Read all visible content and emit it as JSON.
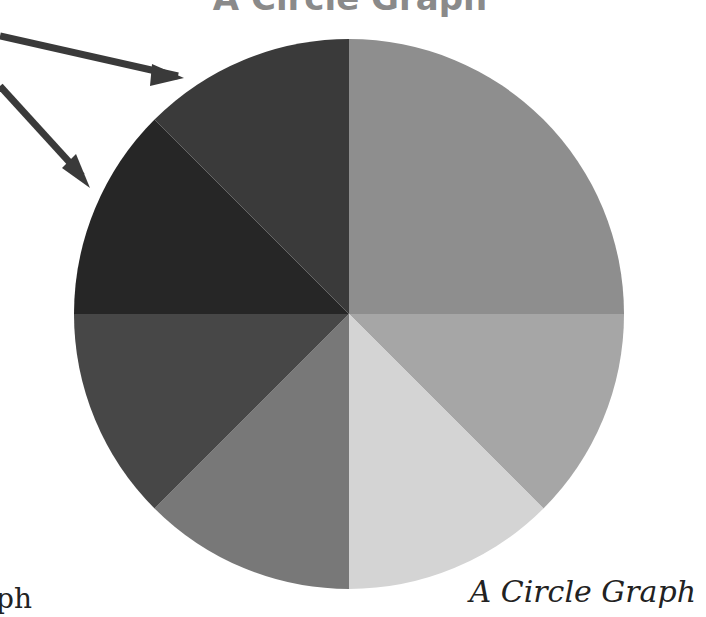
{
  "title": "A Circle Graph",
  "caption": "A Circle Graph",
  "left_text_fragment": "ph",
  "chart_data": {
    "type": "pie",
    "title": "A Circle Graph",
    "caption": "A Circle Graph",
    "start_angle": "12 o'clock, clockwise",
    "categories": [
      "Slice 1",
      "Slice 2",
      "Slice 3",
      "Slice 4",
      "Slice 5",
      "Slice 6",
      "Slice 7"
    ],
    "values": [
      25,
      12.5,
      12.5,
      12.5,
      12.5,
      12.5,
      12.5
    ],
    "colors": [
      "#8e8e8e",
      "#a6a6a6",
      "#d4d4d4",
      "#787878",
      "#474747",
      "#262626",
      "#3a3a3a"
    ],
    "labels_shown": false,
    "legend": "none",
    "annotations": [
      {
        "type": "arrow",
        "points_to": "Slice 7",
        "description": "arrow from left edge pointing to top-left slice"
      },
      {
        "type": "arrow",
        "points_to": "Slice 6",
        "description": "arrow from left edge pointing to upper-left slice"
      }
    ]
  }
}
